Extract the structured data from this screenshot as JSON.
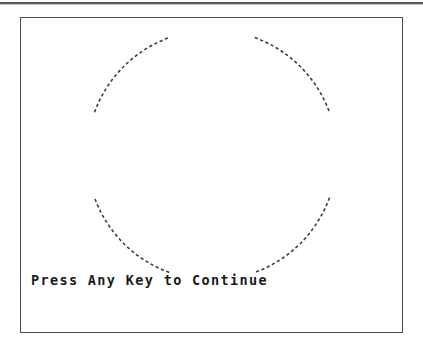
{
  "screen": {
    "width": 423,
    "height": 351,
    "background_color": "#ffffff"
  },
  "top_rule": {
    "name": "top-divider",
    "color": "#5a5a5a",
    "shadow_color": "#c9c9c9"
  },
  "frame": {
    "name": "display-frame",
    "border_color": "#4d4d4d",
    "fill_color": "#ffffff",
    "x": 20,
    "y": 17,
    "width": 383,
    "height": 316
  },
  "graphic": {
    "type": "dashed-circle",
    "description": "dashed circle rendered as four diagonal arc segments with gaps at top, bottom, left and right",
    "stroke_color": "#3d3d3d",
    "center_x": 212,
    "center_y": 155,
    "radius": 125,
    "segment_count": 4,
    "arcs": [
      {
        "name": "arc-top-left",
        "start_angle_deg": 200,
        "end_angle_deg": 250
      },
      {
        "name": "arc-top-right",
        "start_angle_deg": 290,
        "end_angle_deg": 340
      },
      {
        "name": "arc-bottom-right",
        "start_angle_deg": 20,
        "end_angle_deg": 70
      },
      {
        "name": "arc-bottom-left",
        "start_angle_deg": 110,
        "end_angle_deg": 160
      }
    ]
  },
  "prompt": {
    "text": "Press Any Key to Continue",
    "color": "#1b1b1b"
  }
}
